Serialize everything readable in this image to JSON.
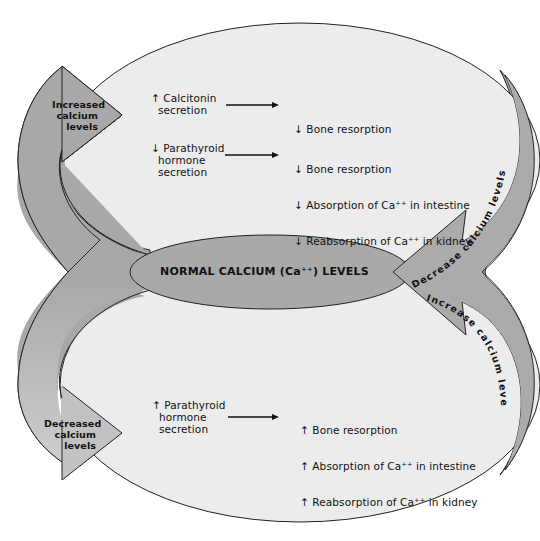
{
  "diagram": {
    "title_center": "NORMAL CALCIUM (Ca⁺⁺) LEVELS",
    "colors": {
      "background": "#ffffff",
      "ellipse_fill": "#ececec",
      "band_fill": "#a9a9a9",
      "band_light": "#c4c4c4",
      "outline": "#222222",
      "text": "#111111"
    },
    "upper_loop": {
      "arrow_label": "Increased\ncalcium\nlevels",
      "return_band_label": "Decrease calcium levels",
      "rows": [
        {
          "cause": "↑ Calcitonin\n  secretion",
          "effects": [
            "↓ Bone resorption"
          ]
        },
        {
          "cause": "↓ Parathyroid\n  hormone\n  secretion",
          "effects": [
            "↓ Bone resorption",
            "↓ Absorption of Ca⁺⁺ in intestine",
            "↓ Reabsorption of Ca⁺⁺ in kidney"
          ]
        }
      ]
    },
    "lower_loop": {
      "arrow_label": "Decreased\ncalcium\nlevels",
      "return_band_label": "Increase calcium levels",
      "rows": [
        {
          "cause": "↑ Parathyroid\n  hormone\n  secretion",
          "effects": [
            "↑ Bone resorption",
            "↑ Absorption of Ca⁺⁺ in intestine",
            "↑ Reabsorption of Ca⁺⁺ in kidney"
          ]
        }
      ]
    }
  }
}
